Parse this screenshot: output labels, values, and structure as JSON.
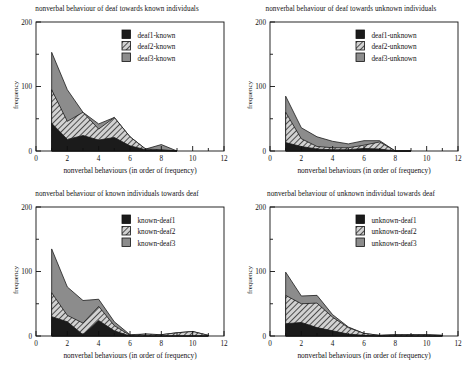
{
  "figure": {
    "panel_count": 4,
    "axis": {
      "x_label": "nonverbal behaviours (in order of frequency)",
      "y_label": "frequency",
      "x_ticks_major": [
        "0",
        "2",
        "4",
        "6",
        "8",
        "10",
        "12"
      ],
      "y_ticks_major": [
        "0",
        "100",
        "200"
      ],
      "xlim": [
        0,
        12
      ],
      "ylim": [
        0,
        200
      ]
    }
  },
  "chart_data": [
    {
      "type": "area",
      "stacked": true,
      "title": "nonverbal behaviour of deaf towards known individuals",
      "xlabel": "nonverbal behaviours (in order of frequency)",
      "ylabel": "frequency",
      "xlim": [
        0,
        12
      ],
      "ylim": [
        0,
        200
      ],
      "grid": false,
      "legend_position": "top-right",
      "x": [
        1,
        2,
        3,
        4,
        5,
        6,
        7,
        8,
        9
      ],
      "series": [
        {
          "name": "deaf1-known",
          "fill": "solid-black",
          "color": "#1b1b1b",
          "values": [
            43,
            18,
            24,
            17,
            21,
            8,
            2,
            1,
            0
          ]
        },
        {
          "name": "deaf2-known",
          "fill": "diagonal-hatch",
          "color": "#c9c9c9",
          "values": [
            52,
            28,
            36,
            17,
            31,
            14,
            1,
            1,
            0
          ]
        },
        {
          "name": "deaf3-known",
          "fill": "solid-gray",
          "color": "#8c8c8c",
          "values": [
            58,
            49,
            0,
            8,
            0,
            0,
            0,
            8,
            0
          ]
        }
      ]
    },
    {
      "type": "area",
      "stacked": true,
      "title": "nonverbal behaviour of deaf towards unknown individuals",
      "xlabel": "nonverbal behaviours (in order of frequency)",
      "ylabel": "frequency",
      "xlim": [
        0,
        12
      ],
      "ylim": [
        0,
        200
      ],
      "grid": false,
      "legend_position": "top-right",
      "x": [
        1,
        2,
        3,
        4,
        5,
        6,
        7,
        8,
        9
      ],
      "series": [
        {
          "name": "deaf1-unknown",
          "fill": "solid-black",
          "color": "#1b1b1b",
          "values": [
            13,
            7,
            3,
            2,
            2,
            4,
            3,
            0,
            0
          ]
        },
        {
          "name": "deaf2-unknown",
          "fill": "diagonal-hatch",
          "color": "#c9c9c9",
          "values": [
            47,
            12,
            4,
            3,
            3,
            5,
            11,
            0,
            0
          ]
        },
        {
          "name": "deaf3-unknown",
          "fill": "solid-gray",
          "color": "#8c8c8c",
          "values": [
            25,
            17,
            15,
            10,
            6,
            7,
            2,
            0,
            0
          ]
        }
      ]
    },
    {
      "type": "area",
      "stacked": true,
      "title": "nonverbal behaviour of known individuals towards deaf",
      "xlabel": "nonverbal behaviours (in order of frequency)",
      "ylabel": "frequency",
      "xlim": [
        0,
        12
      ],
      "ylim": [
        0,
        200
      ],
      "grid": false,
      "legend_position": "top-right",
      "x": [
        1,
        2,
        3,
        4,
        5,
        6,
        7,
        8,
        9,
        10,
        11
      ],
      "series": [
        {
          "name": "known-deaf1",
          "fill": "solid-black",
          "color": "#1b1b1b",
          "values": [
            30,
            22,
            2,
            24,
            8,
            0,
            0,
            0,
            0,
            0,
            0
          ]
        },
        {
          "name": "known-deaf2",
          "fill": "diagonal-hatch",
          "color": "#c9c9c9",
          "values": [
            37,
            10,
            18,
            22,
            8,
            1,
            3,
            2,
            5,
            7,
            1
          ]
        },
        {
          "name": "known-deaf3",
          "fill": "solid-gray",
          "color": "#8c8c8c",
          "values": [
            68,
            44,
            35,
            11,
            6,
            1,
            0,
            0,
            0,
            0,
            0
          ]
        }
      ]
    },
    {
      "type": "area",
      "stacked": true,
      "title": "nonverbal behaviour of unknown individual towards deaf",
      "xlabel": "nonverbal behaviours (in order of frequency)",
      "ylabel": "frequency",
      "xlim": [
        0,
        12
      ],
      "ylim": [
        0,
        200
      ],
      "grid": false,
      "legend_position": "top-right",
      "x": [
        1,
        2,
        3,
        4,
        5,
        6,
        7,
        8,
        9,
        10,
        11
      ],
      "series": [
        {
          "name": "unknown-deaf1",
          "fill": "solid-black",
          "color": "#1b1b1b",
          "values": [
            19,
            21,
            13,
            8,
            3,
            1,
            0,
            0,
            0,
            0,
            0
          ]
        },
        {
          "name": "unknown-deaf2",
          "fill": "diagonal-hatch",
          "color": "#c9c9c9",
          "values": [
            44,
            29,
            38,
            21,
            10,
            3,
            1,
            2,
            2,
            2,
            1
          ]
        },
        {
          "name": "unknown-deaf3",
          "fill": "solid-gray",
          "color": "#8c8c8c",
          "values": [
            36,
            12,
            12,
            4,
            1,
            0,
            0,
            0,
            0,
            0,
            0
          ]
        }
      ]
    }
  ]
}
